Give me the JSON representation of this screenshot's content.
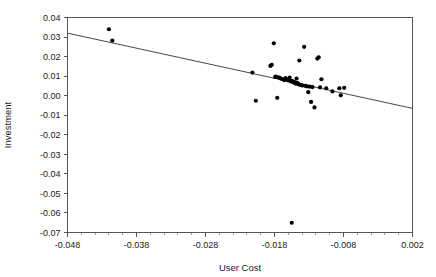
{
  "chart_data": {
    "type": "scatter",
    "title": "",
    "xlabel": "User Cost",
    "ylabel": "Investment",
    "xlim": [
      -0.048,
      0.002
    ],
    "ylim": [
      -0.07,
      0.04
    ],
    "grid": false,
    "legend": null,
    "xticks": [
      -0.048,
      -0.038,
      -0.028,
      -0.018,
      -0.008,
      0.002
    ],
    "xtick_labels": [
      "-0.048",
      "-0.038",
      "-0.028",
      "-0.018",
      "-0.008",
      "0.002"
    ],
    "xtick_minor_step": 0.002,
    "yticks": [
      -0.07,
      -0.06,
      -0.05,
      -0.04,
      -0.03,
      -0.02,
      -0.01,
      0.0,
      0.01,
      0.02,
      0.03,
      0.04
    ],
    "ytick_labels": [
      "-0.07",
      "-0.06",
      "-0.05",
      "-0.04",
      "-0.03",
      "-0.02",
      "-0.01",
      "0.00",
      "0.01",
      "0.02",
      "0.03",
      "0.04"
    ],
    "marker": "filled-circle",
    "marker_size": 2.1,
    "point_color": "#000000",
    "line_color": "#333333",
    "frame_color": "#555555",
    "x": [
      -0.042,
      -0.0415,
      -0.0212,
      -0.0207,
      -0.0186,
      -0.0184,
      -0.0181,
      -0.0179,
      -0.0178,
      -0.0176,
      -0.0174,
      -0.0172,
      -0.017,
      -0.0168,
      -0.0166,
      -0.0164,
      -0.0162,
      -0.016,
      -0.0158,
      -0.0157,
      -0.0156,
      -0.0155,
      -0.0154,
      -0.0152,
      -0.0151,
      -0.015,
      -0.0149,
      -0.0148,
      -0.0147,
      -0.0146,
      -0.0145,
      -0.0144,
      -0.0143,
      -0.0141,
      -0.0139,
      -0.0137,
      -0.0135,
      -0.0133,
      -0.0131,
      -0.0129,
      -0.0127,
      -0.0125,
      -0.0122,
      -0.0118,
      -0.0116,
      -0.0114,
      -0.0112,
      -0.0105,
      -0.0096,
      -0.0086,
      -0.0084,
      -0.0079
    ],
    "y": [
      0.034,
      0.0282,
      0.0118,
      -0.0026,
      0.0152,
      0.0158,
      0.0268,
      0.0096,
      0.0098,
      -0.0011,
      0.0094,
      0.009,
      0.0086,
      0.0084,
      0.008,
      0.009,
      0.0082,
      0.0078,
      0.0092,
      0.0076,
      0.0072,
      -0.065,
      0.0074,
      0.0068,
      0.007,
      0.0064,
      0.0062,
      0.0088,
      0.0066,
      0.006,
      0.0058,
      0.018,
      0.0056,
      0.0054,
      0.0052,
      0.025,
      0.005,
      0.0048,
      0.0018,
      0.0046,
      -0.0032,
      0.0044,
      -0.006,
      0.019,
      0.0196,
      0.0042,
      0.0084,
      0.0038,
      0.0022,
      0.0038,
      0.0002,
      0.004
    ],
    "fit_line": {
      "x_start": -0.048,
      "y_start": 0.032,
      "x_end": 0.002,
      "y_end": -0.0065
    }
  }
}
